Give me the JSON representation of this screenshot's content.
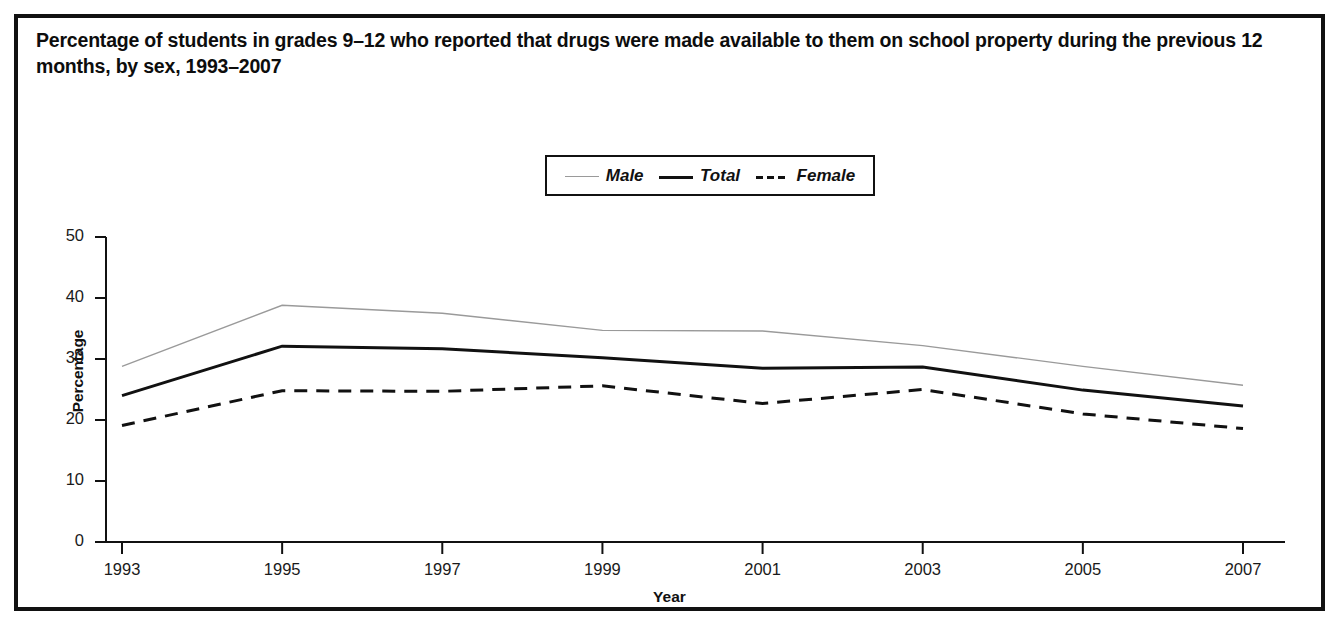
{
  "figure": {
    "title": "Percentage of students in grades 9–12 who reported that drugs were made available to them on school property during the previous 12 months, by sex, 1993–2007",
    "border_color": "#111111",
    "background_color": "#ffffff"
  },
  "legend": {
    "position": "top-center",
    "items": [
      {
        "label": "Male",
        "style": "thin-solid",
        "color": "#9a9a9a",
        "icon": "line-swatch-icon"
      },
      {
        "label": "Total",
        "style": "thick-solid",
        "color": "#111111",
        "icon": "line-swatch-icon"
      },
      {
        "label": "Female",
        "style": "dashed",
        "color": "#111111",
        "icon": "dashed-line-swatch-icon"
      }
    ]
  },
  "axes": {
    "y": {
      "label": "Percentage",
      "ticks": [
        "0",
        "10",
        "20",
        "30",
        "40",
        "50"
      ],
      "min": 0,
      "max": 50
    },
    "x": {
      "label": "Year",
      "ticks": [
        "1993",
        "1995",
        "1997",
        "1999",
        "2001",
        "2003",
        "2005",
        "2007"
      ],
      "min": 1993,
      "max": 2007
    }
  },
  "chart_data": {
    "type": "line",
    "title": "Percentage of students in grades 9–12 who reported that drugs were made available to them on school property during the previous 12 months, by sex, 1993–2007",
    "xlabel": "Year",
    "ylabel": "Percentage",
    "x": [
      1993,
      1995,
      1997,
      1999,
      2001,
      2003,
      2005,
      2007
    ],
    "categories": [
      "1993",
      "1995",
      "1997",
      "1999",
      "2001",
      "2003",
      "2005",
      "2007"
    ],
    "xlim": [
      1993,
      2007
    ],
    "ylim": [
      0,
      50
    ],
    "yticks": [
      0,
      10,
      20,
      30,
      40,
      50
    ],
    "grid": false,
    "legend_position": "top-center",
    "series": [
      {
        "name": "Male",
        "color": "#9a9a9a",
        "linestyle": "solid",
        "linewidth": 1.4,
        "values": [
          28.8,
          38.8,
          37.5,
          34.7,
          34.6,
          32.2,
          28.8,
          25.7
        ]
      },
      {
        "name": "Total",
        "color": "#111111",
        "linestyle": "solid",
        "linewidth": 3.0,
        "values": [
          24.0,
          32.1,
          31.7,
          30.2,
          28.5,
          28.7,
          24.9,
          22.3
        ]
      },
      {
        "name": "Female",
        "color": "#111111",
        "linestyle": "dashed",
        "linewidth": 3.0,
        "values": [
          19.1,
          24.8,
          24.7,
          25.6,
          22.7,
          25.0,
          21.0,
          18.6
        ]
      }
    ]
  }
}
